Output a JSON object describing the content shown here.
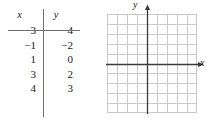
{
  "table": {
    "headers": {
      "x": "x",
      "y": "y"
    },
    "rows": [
      {
        "x": "−3",
        "y": "−4"
      },
      {
        "x": "−1",
        "y": "−2"
      },
      {
        "x": "1",
        "y": "0"
      },
      {
        "x": "3",
        "y": "2"
      },
      {
        "x": "4",
        "y": "3"
      }
    ]
  },
  "grid": {
    "x_axis_label": "x",
    "y_axis_label": "y",
    "columns": 9,
    "rows": 10,
    "origin_col": 4,
    "origin_row": 5,
    "grid_line_color": "#c9c9c9",
    "axis_color": "#3a3a3a",
    "border_color": "#c8c8c8"
  },
  "chart_data": {
    "type": "table",
    "title": "",
    "xlabel": "x",
    "ylabel": "y",
    "columns": [
      "x",
      "y"
    ],
    "x": [
      -3,
      -1,
      1,
      3,
      4
    ],
    "y": [
      -4,
      -2,
      0,
      2,
      3
    ],
    "rows": [
      [
        -3,
        -4
      ],
      [
        -1,
        -2
      ],
      [
        1,
        0
      ],
      [
        3,
        2
      ],
      [
        4,
        3
      ]
    ],
    "grid": true,
    "legend": "none",
    "plot_area": {
      "description": "blank coordinate plane, no points plotted",
      "xlim": [
        -4,
        5
      ],
      "ylim": [
        -5,
        5
      ]
    }
  }
}
